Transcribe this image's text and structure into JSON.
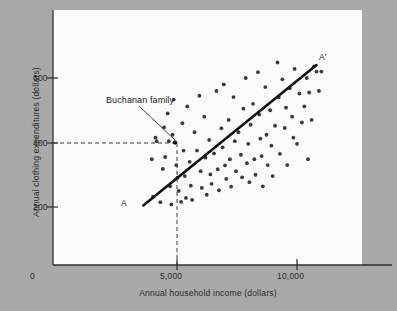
{
  "chart_data": {
    "type": "scatter",
    "title": "",
    "xlabel": "Annual household income (dollars)",
    "ylabel": "Annual clothing expenditures (dollars)",
    "xlim": [
      0,
      11500
    ],
    "ylim": [
      0,
      720
    ],
    "xticks": [
      "0",
      "5,000",
      "10,000"
    ],
    "xtick_values": [
      0,
      5000,
      10000
    ],
    "yticks": [
      "200",
      "400",
      "600"
    ],
    "ytick_values": [
      200,
      400,
      600
    ],
    "grid": false,
    "legend": "none",
    "point_color": "#3a3a3a",
    "line_color": "#111111",
    "background_color": "#a9a9a9",
    "panel_color": "#fbfbfa",
    "annotations": [
      {
        "name": "buchanan-family",
        "text": "Buchanan family",
        "x": 5000,
        "y": 400,
        "leader": true,
        "guide_lines": "dashed to x axis and y axis"
      },
      {
        "name": "line-start-label",
        "text": "A",
        "x": 3700,
        "y": 205
      },
      {
        "name": "line-end-label",
        "text": "A'",
        "x": 10850,
        "y": 648
      }
    ],
    "trendline": {
      "name": "AA'",
      "x0": 3700,
      "y0": 205,
      "x1": 10800,
      "y1": 640
    },
    "series": [
      {
        "name": "households",
        "points": [
          [
            4050,
            348
          ],
          [
            4200,
            415
          ],
          [
            4250,
            404
          ],
          [
            4100,
            232
          ],
          [
            4400,
            215
          ],
          [
            4500,
            318
          ],
          [
            4550,
            447
          ],
          [
            4600,
            355
          ],
          [
            4700,
            490
          ],
          [
            4750,
            404
          ],
          [
            4800,
            264
          ],
          [
            4850,
            208
          ],
          [
            4900,
            424
          ],
          [
            4950,
            533
          ],
          [
            5000,
            400
          ],
          [
            5050,
            330
          ],
          [
            5100,
            291
          ],
          [
            5150,
            250
          ],
          [
            5250,
            216
          ],
          [
            5300,
            460
          ],
          [
            5350,
            375
          ],
          [
            5400,
            296
          ],
          [
            5450,
            228
          ],
          [
            5500,
            512
          ],
          [
            5600,
            340
          ],
          [
            5650,
            266
          ],
          [
            5700,
            222
          ],
          [
            5800,
            432
          ],
          [
            5900,
            375
          ],
          [
            6000,
            545
          ],
          [
            6050,
            311
          ],
          [
            6100,
            259
          ],
          [
            6200,
            480
          ],
          [
            6250,
            353
          ],
          [
            6300,
            238
          ],
          [
            6400,
            408
          ],
          [
            6450,
            301
          ],
          [
            6500,
            272
          ],
          [
            6600,
            366
          ],
          [
            6700,
            560
          ],
          [
            6750,
            317
          ],
          [
            6800,
            252
          ],
          [
            6900,
            444
          ],
          [
            6950,
            385
          ],
          [
            7000,
            580
          ],
          [
            7050,
            329
          ],
          [
            7100,
            287
          ],
          [
            7200,
            470
          ],
          [
            7250,
            348
          ],
          [
            7300,
            263
          ],
          [
            7400,
            541
          ],
          [
            7450,
            404
          ],
          [
            7500,
            311
          ],
          [
            7600,
            432
          ],
          [
            7700,
            362
          ],
          [
            7750,
            292
          ],
          [
            7800,
            505
          ],
          [
            7900,
            600
          ],
          [
            7950,
            336
          ],
          [
            8000,
            396
          ],
          [
            8050,
            277
          ],
          [
            8100,
            455
          ],
          [
            8200,
            520
          ],
          [
            8250,
            348
          ],
          [
            8300,
            300
          ],
          [
            8400,
            618
          ],
          [
            8450,
            487
          ],
          [
            8500,
            412
          ],
          [
            8550,
            358
          ],
          [
            8600,
            264
          ],
          [
            8700,
            572
          ],
          [
            8750,
            424
          ],
          [
            8800,
            330
          ],
          [
            8900,
            500
          ],
          [
            8950,
            390
          ],
          [
            9000,
            296
          ],
          [
            9100,
            452
          ],
          [
            9200,
            648
          ],
          [
            9250,
            540
          ],
          [
            9300,
            365
          ],
          [
            9400,
            596
          ],
          [
            9500,
            445
          ],
          [
            9550,
            508
          ],
          [
            9600,
            330
          ],
          [
            9700,
            568
          ],
          [
            9800,
            480
          ],
          [
            9900,
            628
          ],
          [
            10000,
            396
          ],
          [
            10100,
            552
          ],
          [
            10200,
            462
          ],
          [
            10300,
            512
          ],
          [
            10400,
            600
          ],
          [
            10500,
            555
          ],
          [
            10600,
            470
          ],
          [
            10700,
            636
          ],
          [
            10800,
            620
          ],
          [
            10900,
            560
          ],
          [
            11000,
            620
          ],
          [
            10450,
            348
          ],
          [
            9850,
            415
          ]
        ]
      }
    ]
  }
}
